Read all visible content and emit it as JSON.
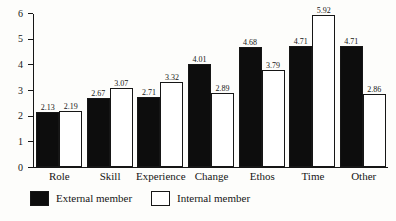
{
  "chart_data": {
    "type": "bar",
    "title": "",
    "xlabel": "",
    "ylabel": "",
    "ylim": [
      0,
      6
    ],
    "yticks": [
      "0",
      "1",
      "2",
      "3",
      "4",
      "5",
      "6"
    ],
    "grid": false,
    "legend_position": "bottom-left",
    "categories": [
      "Role",
      "Skill",
      "Experience",
      "Change",
      "Ethos",
      "Time",
      "Other"
    ],
    "series": [
      {
        "name": "External member",
        "color": "#0d0d0d",
        "values": [
          2.13,
          2.67,
          2.71,
          4.01,
          4.68,
          4.71,
          4.71
        ],
        "labels": [
          "2.13",
          "2.67",
          "2.71",
          "4.01",
          "4.68",
          "4.71",
          "4.71"
        ]
      },
      {
        "name": "Internal member",
        "color": "#ffffff",
        "values": [
          2.19,
          3.07,
          3.32,
          2.89,
          3.79,
          5.92,
          2.86
        ],
        "labels": [
          "2.19",
          "3.07",
          "3.32",
          "2.89",
          "3.79",
          "5.92",
          "2.86"
        ]
      }
    ]
  },
  "legend": {
    "items": [
      {
        "label": "External member",
        "swatch": "external"
      },
      {
        "label": "Internal member",
        "swatch": "internal"
      }
    ]
  }
}
